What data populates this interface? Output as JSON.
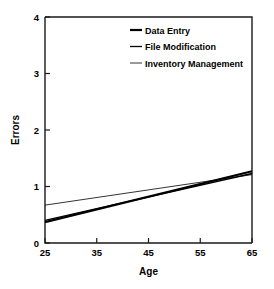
{
  "chart_data": {
    "type": "line",
    "title": "",
    "xlabel": "Age",
    "ylabel": "Errors",
    "xlim": [
      25,
      65
    ],
    "ylim": [
      0,
      4
    ],
    "x_ticks": [
      25,
      35,
      45,
      55,
      65
    ],
    "y_ticks": [
      0,
      1,
      2,
      3,
      4
    ],
    "grid": false,
    "legend_position": "top-right-inside",
    "x": [
      25,
      65
    ],
    "series": [
      {
        "name": "Data Entry",
        "values": [
          0.37,
          1.27
        ],
        "color": "#000000",
        "line_width": 2.2
      },
      {
        "name": "File Modification",
        "values": [
          0.4,
          1.23
        ],
        "color": "#000000",
        "line_width": 1.3
      },
      {
        "name": "Inventory Management",
        "values": [
          0.67,
          1.21
        ],
        "color": "#000000",
        "line_width": 0.8
      }
    ]
  },
  "axes": {
    "y_label": "Errors",
    "x_label": "Age",
    "y_tick_labels": [
      "0",
      "1",
      "2",
      "3",
      "4"
    ],
    "x_tick_labels": [
      "25",
      "35",
      "45",
      "55",
      "65"
    ]
  },
  "legend": {
    "entries": [
      {
        "label": "Data Entry"
      },
      {
        "label": "File Modification"
      },
      {
        "label": "Inventory Management"
      }
    ]
  }
}
